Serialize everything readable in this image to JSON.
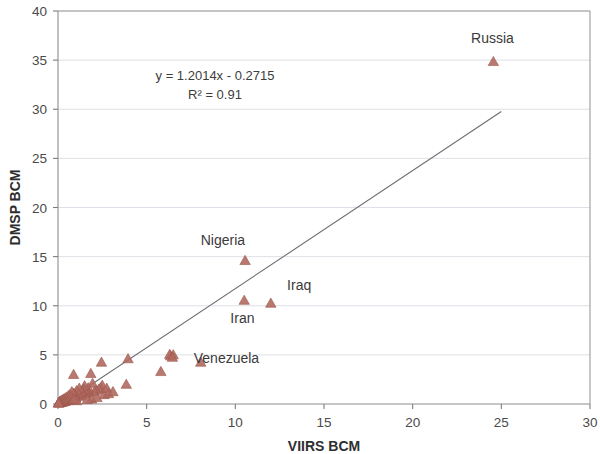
{
  "chart_data": {
    "type": "scatter",
    "title": "",
    "xlabel": "VIIRS BCM",
    "ylabel": "DMSP BCM",
    "xlim": [
      0,
      30
    ],
    "ylim": [
      0,
      40
    ],
    "xticks": [
      0,
      5,
      10,
      15,
      20,
      25,
      30
    ],
    "yticks": [
      0,
      5,
      10,
      15,
      20,
      25,
      30,
      35,
      40
    ],
    "xtick_labels": [
      "0",
      "5",
      "10",
      "15",
      "20",
      "25",
      "30"
    ],
    "ytick_labels": [
      "0",
      "5",
      "10",
      "15",
      "20",
      "25",
      "30",
      "35",
      "40"
    ],
    "grid": "horizontal",
    "legend": "none",
    "marker_shape": "triangle",
    "marker_color": "#b06a60",
    "trendline": {
      "equation_label": "y = 1.2014x - 0.2715",
      "r2_label": "R² = 0.91",
      "slope": 1.2014,
      "intercept": -0.2715,
      "r_squared": 0.91,
      "x_start": 0.25,
      "x_end": 25.0,
      "color": "#6e6e72"
    },
    "annotations": [
      {
        "text": "Russia",
        "x": 24.5,
        "y": 36.7
      },
      {
        "text": "Nigeria",
        "x": 9.3,
        "y": 16.2
      },
      {
        "text": "Iraq",
        "x": 13.6,
        "y": 11.6
      },
      {
        "text": "Iran",
        "x": 10.4,
        "y": 8.2
      },
      {
        "text": "Venezuela",
        "x": 9.5,
        "y": 4.2
      }
    ],
    "labeled_points": [
      {
        "name": "Russia",
        "x": 24.55,
        "y": 34.8
      },
      {
        "name": "Nigeria",
        "x": 10.55,
        "y": 14.55
      },
      {
        "name": "Iran",
        "x": 10.5,
        "y": 10.5
      },
      {
        "name": "Iraq",
        "x": 12.0,
        "y": 10.2
      },
      {
        "name": "Venezuela",
        "x": 8.05,
        "y": 4.2
      }
    ],
    "points": [
      [
        24.55,
        34.8
      ],
      [
        10.55,
        14.55
      ],
      [
        10.5,
        10.5
      ],
      [
        12.0,
        10.2
      ],
      [
        8.05,
        4.2
      ],
      [
        6.5,
        4.95
      ],
      [
        6.35,
        4.85
      ],
      [
        6.3,
        5.0
      ],
      [
        6.45,
        4.7
      ],
      [
        5.8,
        3.25
      ],
      [
        3.95,
        4.55
      ],
      [
        3.85,
        1.95
      ],
      [
        2.45,
        4.2
      ],
      [
        2.5,
        1.85
      ],
      [
        2.4,
        1.6
      ],
      [
        2.3,
        1.45
      ],
      [
        2.15,
        1.35
      ],
      [
        2.05,
        1.2
      ],
      [
        1.95,
        2.05
      ],
      [
        1.85,
        3.05
      ],
      [
        1.75,
        1.1
      ],
      [
        1.7,
        1.6
      ],
      [
        1.6,
        1.3
      ],
      [
        1.55,
        1.0
      ],
      [
        1.5,
        1.8
      ],
      [
        1.45,
        1.45
      ],
      [
        1.4,
        0.95
      ],
      [
        1.35,
        1.25
      ],
      [
        1.3,
        0.8
      ],
      [
        1.25,
        1.1
      ],
      [
        1.2,
        1.55
      ],
      [
        1.15,
        0.7
      ],
      [
        1.1,
        0.95
      ],
      [
        1.05,
        1.3
      ],
      [
        1.0,
        0.6
      ],
      [
        0.95,
        0.85
      ],
      [
        0.9,
        1.05
      ],
      [
        0.88,
        2.95
      ],
      [
        0.85,
        0.55
      ],
      [
        0.8,
        0.75
      ],
      [
        0.78,
        1.2
      ],
      [
        0.75,
        0.45
      ],
      [
        0.7,
        0.65
      ],
      [
        0.68,
        0.9
      ],
      [
        0.65,
        0.35
      ],
      [
        0.6,
        0.55
      ],
      [
        0.58,
        0.8
      ],
      [
        0.55,
        0.3
      ],
      [
        0.5,
        0.45
      ],
      [
        0.48,
        0.65
      ],
      [
        0.45,
        0.25
      ],
      [
        0.42,
        0.38
      ],
      [
        0.4,
        0.55
      ],
      [
        0.38,
        0.2
      ],
      [
        0.35,
        0.32
      ],
      [
        0.32,
        0.45
      ],
      [
        0.3,
        0.16
      ],
      [
        0.28,
        0.26
      ],
      [
        0.25,
        0.38
      ],
      [
        0.22,
        0.12
      ],
      [
        0.2,
        0.2
      ],
      [
        0.18,
        0.3
      ],
      [
        0.15,
        0.1
      ],
      [
        0.13,
        0.16
      ],
      [
        0.1,
        0.22
      ],
      [
        0.08,
        0.07
      ],
      [
        0.06,
        0.12
      ],
      [
        0.05,
        0.05
      ],
      [
        0.04,
        0.09
      ],
      [
        0.03,
        0.03
      ],
      [
        1.9,
        0.45
      ],
      [
        2.6,
        0.9
      ],
      [
        2.2,
        0.6
      ],
      [
        1.65,
        0.4
      ],
      [
        1.05,
        0.28
      ],
      [
        0.9,
        0.4
      ],
      [
        2.75,
        1.55
      ],
      [
        2.85,
        1.0
      ],
      [
        3.1,
        1.2
      ]
    ]
  }
}
